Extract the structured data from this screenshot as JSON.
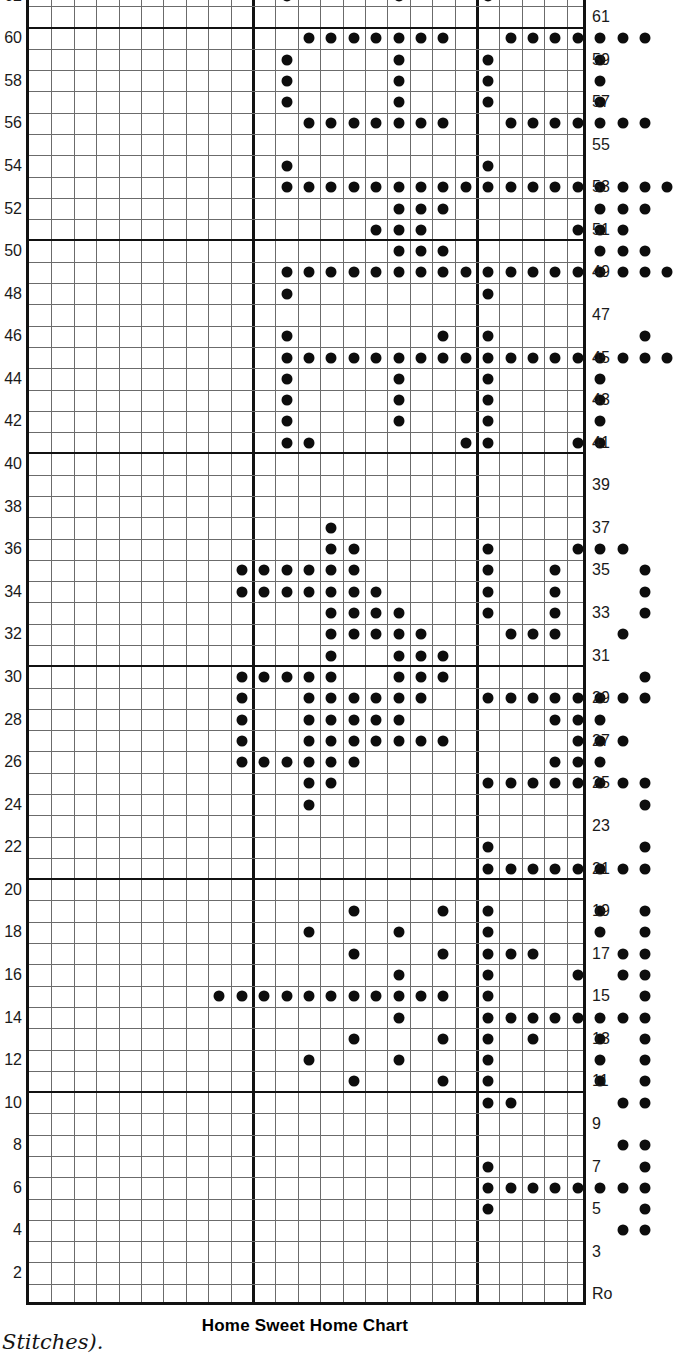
{
  "caption": "Home Sweet Home Chart",
  "side_note": "Stitches).",
  "axis": {
    "row_label_abbrev_right": "Ro",
    "left_labels": [
      2,
      4,
      6,
      8,
      10,
      12,
      14,
      16,
      18,
      20,
      22,
      24,
      26,
      28,
      30,
      32,
      34,
      36,
      38,
      40,
      42,
      44,
      46,
      48,
      50,
      52,
      54,
      56,
      58,
      60,
      62
    ],
    "right_labels": [
      3,
      5,
      7,
      9,
      11,
      13,
      15,
      17,
      19,
      21,
      23,
      25,
      27,
      29,
      31,
      33,
      35,
      37,
      39,
      41,
      43,
      45,
      47,
      49,
      51,
      53,
      55,
      57,
      59,
      61
    ]
  },
  "chart_data": {
    "type": "heatmap",
    "title": "Home Sweet Home Chart",
    "xlabel": "Stitches",
    "ylabel": "Rows",
    "grid": true,
    "columns": 25,
    "rows": 62,
    "cell_symbol": "filled-dot",
    "heavy_gridline_columns": [
      10,
      20
    ],
    "heavy_gridline_rows": [
      10,
      20,
      30,
      40,
      50,
      60
    ],
    "colors": {
      "dot": "#0d0d0d",
      "gridline": "#6b6b6b",
      "border": "#111111",
      "background": "#ffffff"
    },
    "legend": [
      {
        "symbol": "filled-dot",
        "label": "purl stitch"
      }
    ],
    "filled_cells_by_row": {
      "62": [
        12,
        17,
        21
      ],
      "60": [
        13,
        14,
        15,
        16,
        17,
        18,
        19,
        22,
        23,
        24,
        25,
        26,
        27,
        28
      ],
      "59": [
        12,
        17,
        21,
        26
      ],
      "58": [
        12,
        17,
        21,
        26
      ],
      "57": [
        12,
        17,
        21,
        26
      ],
      "56": [
        13,
        14,
        15,
        16,
        17,
        18,
        19,
        22,
        23,
        24,
        25,
        26,
        27,
        28
      ],
      "54": [
        12,
        21
      ],
      "53": [
        12,
        13,
        14,
        15,
        16,
        17,
        18,
        19,
        20,
        21,
        22,
        23,
        24,
        25,
        26,
        27,
        28,
        29
      ],
      "52": [
        17,
        18,
        19,
        26,
        27,
        28
      ],
      "51": [
        16,
        17,
        18,
        25,
        26,
        27
      ],
      "50": [
        17,
        18,
        19,
        26,
        27,
        28
      ],
      "49": [
        12,
        13,
        14,
        15,
        16,
        17,
        18,
        19,
        20,
        21,
        22,
        23,
        24,
        25,
        26,
        27,
        28,
        29
      ],
      "48": [
        12,
        21
      ],
      "46": [
        12,
        19,
        21,
        28
      ],
      "45": [
        12,
        13,
        14,
        15,
        16,
        17,
        18,
        19,
        20,
        21,
        22,
        23,
        24,
        25,
        26,
        27,
        28,
        29
      ],
      "44": [
        12,
        17,
        21,
        26
      ],
      "43": [
        12,
        17,
        21,
        26
      ],
      "42": [
        12,
        17,
        21,
        26
      ],
      "41": [
        12,
        13,
        20,
        21,
        25,
        26
      ],
      "37": [
        14
      ],
      "36": [
        14,
        15,
        21,
        25,
        26,
        27
      ],
      "35": [
        10,
        11,
        12,
        13,
        14,
        15,
        21,
        24,
        28
      ],
      "34": [
        10,
        11,
        12,
        13,
        14,
        15,
        16,
        21,
        24,
        28
      ],
      "33": [
        14,
        15,
        16,
        17,
        21,
        24,
        28
      ],
      "32": [
        14,
        15,
        16,
        17,
        18,
        22,
        23,
        24,
        27
      ],
      "31": [
        14,
        17,
        18,
        19
      ],
      "30": [
        10,
        11,
        12,
        13,
        14,
        17,
        18,
        19,
        28
      ],
      "29": [
        10,
        13,
        14,
        15,
        16,
        17,
        18,
        21,
        22,
        23,
        24,
        25,
        26,
        27,
        28
      ],
      "28": [
        10,
        13,
        14,
        15,
        16,
        17,
        24,
        25,
        26
      ],
      "27": [
        10,
        13,
        14,
        15,
        16,
        17,
        18,
        19,
        25,
        26,
        27
      ],
      "26": [
        10,
        11,
        12,
        13,
        14,
        15,
        24,
        25,
        26
      ],
      "25": [
        13,
        14,
        21,
        22,
        23,
        24,
        25,
        26,
        27,
        28
      ],
      "24": [
        13,
        28
      ],
      "22": [
        21,
        28
      ],
      "21": [
        21,
        22,
        23,
        24,
        25,
        26,
        27,
        28
      ],
      "19": [
        15,
        19,
        21,
        26,
        28
      ],
      "18": [
        13,
        17,
        21,
        26,
        28
      ],
      "17": [
        15,
        19,
        23,
        21,
        22,
        27,
        28
      ],
      "16": [
        17,
        21,
        25,
        27,
        28
      ],
      "15": [
        9,
        10,
        11,
        12,
        13,
        14,
        15,
        16,
        17,
        18,
        19,
        21,
        28
      ],
      "14": [
        17,
        21,
        22,
        23,
        24,
        25,
        26,
        27,
        28
      ],
      "13": [
        15,
        19,
        23,
        21,
        26,
        28
      ],
      "12": [
        13,
        17,
        21,
        21,
        26,
        28
      ],
      "11": [
        15,
        19,
        21,
        26,
        28
      ],
      "10": [
        21,
        22,
        27,
        28
      ],
      "8": [
        27,
        28
      ],
      "7": [
        21,
        28
      ],
      "6": [
        21,
        22,
        23,
        24,
        25,
        26,
        27,
        28
      ],
      "5": [
        21,
        28
      ],
      "4": [
        27,
        28
      ]
    }
  }
}
